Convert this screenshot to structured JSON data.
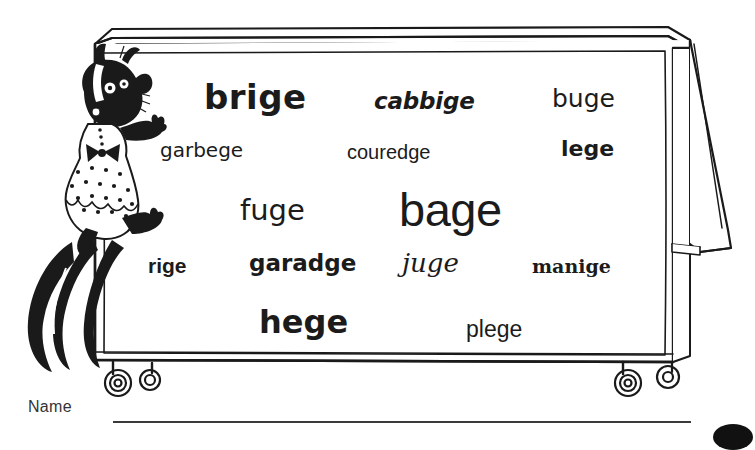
{
  "worksheet": {
    "title": "Spelling practice worksheet - words ending in -ge",
    "name_label": "Name"
  },
  "illustration": {
    "character": "skunk-in-polka-dot-dress",
    "object": "flip-chart-easel-on-casters",
    "ink_color": "#1a1a1a",
    "paper_color": "#ffffff"
  },
  "board": {
    "words": [
      {
        "id": "brige",
        "text": "brige",
        "style": "bold-rounded-sans"
      },
      {
        "id": "cabbige",
        "text": "cabbige",
        "style": "bold-italic-sans"
      },
      {
        "id": "buge",
        "text": "buge",
        "style": "regular-rounded-sans"
      },
      {
        "id": "garbege",
        "text": "garbege",
        "style": "regular-rounded-sans"
      },
      {
        "id": "couredge",
        "text": "couredge",
        "style": "light-sans"
      },
      {
        "id": "lege",
        "text": "lege",
        "style": "bold-sans"
      },
      {
        "id": "fuge",
        "text": "fuge",
        "style": "handwriting-sans"
      },
      {
        "id": "bage",
        "text": "bage",
        "style": "large-geometric-sans"
      },
      {
        "id": "rige",
        "text": "rige",
        "style": "bold-sans"
      },
      {
        "id": "garadge",
        "text": "garadge",
        "style": "bold-rounded-sans"
      },
      {
        "id": "juge",
        "text": "juge",
        "style": "italic-calligraphic-serif"
      },
      {
        "id": "manige",
        "text": "manige",
        "style": "bold-serif"
      },
      {
        "id": "hege",
        "text": "hege",
        "style": "heavy-bold-sans"
      },
      {
        "id": "plege",
        "text": "plege",
        "style": "regular-sans"
      }
    ]
  }
}
